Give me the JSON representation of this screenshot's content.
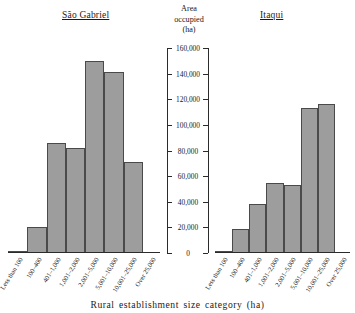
{
  "figure": {
    "x_caption": "Rural  establishment size category  (ha)",
    "axis_heading_lines": [
      "Area",
      "occupied",
      "(ha)"
    ],
    "panels": [
      {
        "title": "São Gabriel"
      },
      {
        "title": "Itaqui"
      }
    ],
    "tick_labels": [
      "160,000",
      "140,000",
      "120,000",
      "100,000",
      "80,000",
      "60,000",
      "40,000",
      "20,000",
      "0"
    ]
  },
  "chart_data": {
    "type": "bar",
    "xlabel": "Rural establishment size category (ha)",
    "ylabel": "Area occupied (ha)",
    "ylim": [
      0,
      160000
    ],
    "ytick_interval": 20000,
    "yticks": [
      0,
      20000,
      40000,
      60000,
      80000,
      100000,
      120000,
      140000,
      160000
    ],
    "grid": false,
    "legend": "none",
    "axis_position": "center-shared",
    "categories": [
      "Less than 100",
      "100–400",
      "401–1,000",
      "1,001–2,000",
      "2,001–5,000",
      "5,001–10,000",
      "10,001–25,000",
      "Over 25,000"
    ],
    "series": [
      {
        "name": "São Gabriel",
        "values": [
          1500,
          20000,
          86000,
          82000,
          150000,
          141000,
          71000,
          0
        ]
      },
      {
        "name": "Itaqui",
        "values": [
          1500,
          19000,
          38000,
          55000,
          53000,
          113000,
          116000,
          0
        ]
      }
    ],
    "colors": {
      "bar_fill": "#9d9d9d",
      "bar_edge": "#4a4a4a",
      "axis": "#2b2b2b"
    }
  }
}
